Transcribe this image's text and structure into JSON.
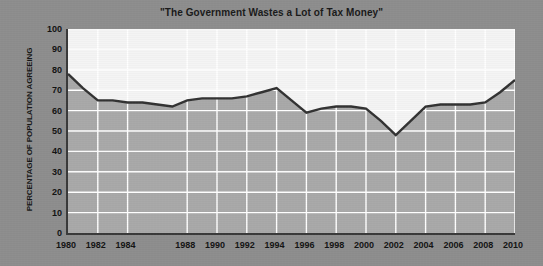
{
  "chart_data": {
    "type": "area",
    "title": "\"The Government Wastes a Lot of Tax Money\"",
    "xlabel": "",
    "ylabel": "PERCENTAGE OF POPULATION AGREEING",
    "ylim": [
      0,
      100
    ],
    "xlim": [
      1980,
      2010
    ],
    "yticks": [
      0,
      10,
      20,
      30,
      40,
      50,
      60,
      70,
      80,
      90,
      100
    ],
    "xticks": [
      1980,
      1982,
      1984,
      1988,
      1990,
      1992,
      1994,
      1996,
      1998,
      2000,
      2002,
      2004,
      2006,
      2008,
      2010
    ],
    "grid": true,
    "legend": null,
    "x": [
      1980,
      1981,
      1982,
      1983,
      1984,
      1985,
      1986,
      1987,
      1988,
      1989,
      1990,
      1991,
      1992,
      1993,
      1994,
      1995,
      1996,
      1997,
      1998,
      1999,
      2000,
      2001,
      2002,
      2003,
      2004,
      2005,
      2006,
      2007,
      2008,
      2009,
      2010
    ],
    "values": [
      78,
      71,
      65,
      65,
      64,
      64,
      63,
      62,
      65,
      66,
      66,
      66,
      67,
      69,
      71,
      65,
      59,
      61,
      62,
      62,
      61,
      55,
      48,
      55,
      62,
      63,
      63,
      63,
      64,
      69,
      75
    ],
    "series": [
      {
        "name": "Percentage agreeing",
        "values": [
          78,
          71,
          65,
          65,
          64,
          64,
          63,
          62,
          65,
          66,
          66,
          66,
          67,
          69,
          71,
          65,
          59,
          61,
          62,
          62,
          61,
          55,
          48,
          55,
          62,
          63,
          63,
          63,
          64,
          69,
          75
        ]
      }
    ],
    "colors": {
      "line": "#333333",
      "area_fill": "#a9a9a9",
      "plot_background": "#f4f4f4",
      "gridline": "#ffffff",
      "figure_background": "#8e8e8e",
      "axis": "#3a3a3a",
      "text": "#141414"
    }
  }
}
